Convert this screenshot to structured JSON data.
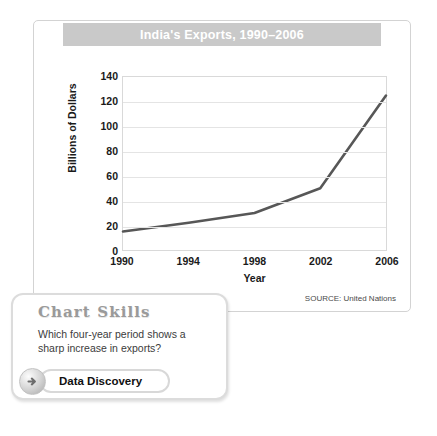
{
  "chart_panel": {
    "title": "India's Exports, 1990–2006",
    "source_note": "SOURCE: United Nations"
  },
  "chart_data": {
    "type": "line",
    "title": "India's Exports, 1990–2006",
    "xlabel": "Year",
    "ylabel": "Billions of Dollars",
    "x": [
      1990,
      1994,
      1998,
      2002,
      2006
    ],
    "values": [
      15,
      22,
      30,
      50,
      125
    ],
    "xticklabels": [
      "1990",
      "1994",
      "1998",
      "2002",
      "2006"
    ],
    "yticklabels": [
      "140",
      "120",
      "100",
      "80",
      "60",
      "40",
      "20",
      "0"
    ],
    "ytickvalues": [
      140,
      120,
      100,
      80,
      60,
      40,
      20,
      0
    ],
    "xlim": [
      1990,
      2006
    ],
    "ylim": [
      0,
      140
    ],
    "grid": "horizontal",
    "legend": "none",
    "series_color": "#575757"
  },
  "callout": {
    "heading": "Chart Skills",
    "question": "Which four-year period shows a sharp increase in exports?",
    "button_label": "Data Discovery",
    "arrow_icon": "arrow-right-circle-icon"
  }
}
